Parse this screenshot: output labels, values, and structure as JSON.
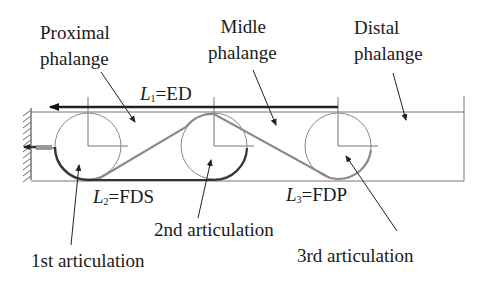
{
  "labels": {
    "proximal_line1": "Proximal",
    "proximal_line2": "phalange",
    "middle_line1": "Midle",
    "middle_line2": "phalange",
    "distal_line1": "Distal",
    "distal_line2": "phalange",
    "articulation1": "1st articulation",
    "articulation2": "2nd articulation",
    "articulation3": "3rd articulation"
  },
  "tendons": {
    "l1": {
      "symbol": "L",
      "sub": "1",
      "name": "=ED"
    },
    "l2": {
      "symbol": "L",
      "sub": "2",
      "name": "=FDS"
    },
    "l3": {
      "symbol": "L",
      "sub": "3",
      "name": "=FDP"
    }
  },
  "colors": {
    "line": "#777777",
    "tendon_dark": "#222222",
    "tendon_gray": "#8a8a8a"
  }
}
